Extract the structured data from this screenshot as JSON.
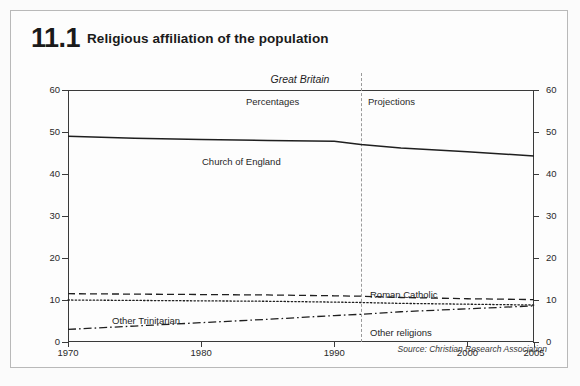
{
  "figure": {
    "number": "11.1",
    "title": "Religious affiliation of the population",
    "geography": "Great Britain",
    "band_left_label": "Percentages",
    "band_right_label": "Projections",
    "source": "Source: Christian Research Association"
  },
  "axis": {
    "y_ticks": [
      "0",
      "10",
      "20",
      "30",
      "40",
      "50",
      "60"
    ],
    "x_ticks": [
      "1970",
      "1980",
      "1990",
      "2000",
      "2005"
    ]
  },
  "series_labels": {
    "church_of_england": "Church of England",
    "roman_catholic": "Roman Catholic",
    "other_trinitarian": "Other Trinitarian",
    "other_religions": "Other religions"
  },
  "colors": {
    "line": "#1f1f1f",
    "axis": "#3a3a3a",
    "divider": "#9a9a9a",
    "frame": "#b9b9b9",
    "background": "#fdfdfd"
  },
  "chart_data": {
    "type": "line",
    "title": "Religious affiliation of the population",
    "subtitle": "Great Britain",
    "xlabel": "",
    "ylabel": "Percentages",
    "xlim": [
      1970,
      2005
    ],
    "ylim": [
      0,
      60
    ],
    "grid": false,
    "legend": "inline-annotations",
    "projection_start": 1992,
    "annotations": [
      "Percentages",
      "Projections",
      "Source: Christian Research Association"
    ],
    "x": [
      1970,
      1975,
      1980,
      1985,
      1990,
      1992,
      1995,
      2000,
      2005
    ],
    "series": [
      {
        "name": "Church of England",
        "style": "solid",
        "values": [
          49.0,
          48.5,
          48.2,
          48.0,
          47.8,
          47.0,
          46.2,
          45.3,
          44.3
        ]
      },
      {
        "name": "Roman Catholic",
        "style": "dashed",
        "values": [
          11.5,
          11.4,
          11.3,
          11.2,
          11.0,
          10.9,
          10.6,
          10.3,
          10.1
        ]
      },
      {
        "name": "Other Trinitarian",
        "style": "dotted",
        "values": [
          10.0,
          9.9,
          9.8,
          9.7,
          9.5,
          9.4,
          9.2,
          9.0,
          8.8
        ]
      },
      {
        "name": "Other religions",
        "style": "dash-dot",
        "values": [
          3.0,
          3.8,
          4.6,
          5.4,
          6.3,
          6.6,
          7.2,
          7.9,
          8.6
        ]
      }
    ]
  }
}
